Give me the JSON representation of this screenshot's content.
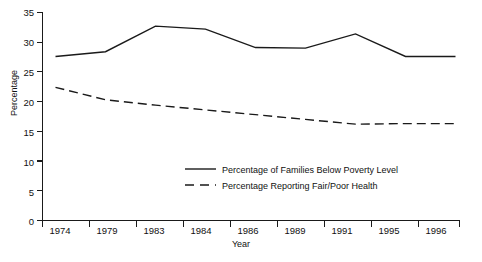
{
  "chart_data": {
    "type": "line",
    "title": "",
    "xlabel": "Year",
    "ylabel": "Percentage",
    "categories": [
      "1974",
      "1979",
      "1983",
      "1984",
      "1986",
      "1989",
      "1991",
      "1995",
      "1996"
    ],
    "ylim": [
      0,
      35
    ],
    "yticks": [
      0,
      5,
      10,
      15,
      20,
      25,
      30,
      35
    ],
    "ytick_labels": [
      "0",
      "5",
      "10",
      "15",
      "20",
      "25",
      "30",
      "35"
    ],
    "grid": false,
    "legend_position": "center",
    "series": [
      {
        "name": "Percentage of Families Below Poverty Level",
        "style": "solid",
        "color": "#1a1a1a",
        "values": [
          27.6,
          28.4,
          32.7,
          32.2,
          29.1,
          29.0,
          31.4,
          27.6,
          27.6
        ]
      },
      {
        "name": "Percentage Reporting Fair/Poor Health",
        "style": "dashed",
        "color": "#1a1a1a",
        "values": [
          22.4,
          20.3,
          19.4,
          18.6,
          17.8,
          17.0,
          16.2,
          16.3,
          16.3
        ]
      }
    ]
  },
  "legend": {
    "items": [
      {
        "label": "Percentage of Families Below Poverty Level",
        "style": "solid"
      },
      {
        "label": "Percentage Reporting Fair/Poor Health",
        "style": "dashed"
      }
    ]
  },
  "axes": {
    "y_title": "Percentage",
    "x_title": "Year"
  }
}
